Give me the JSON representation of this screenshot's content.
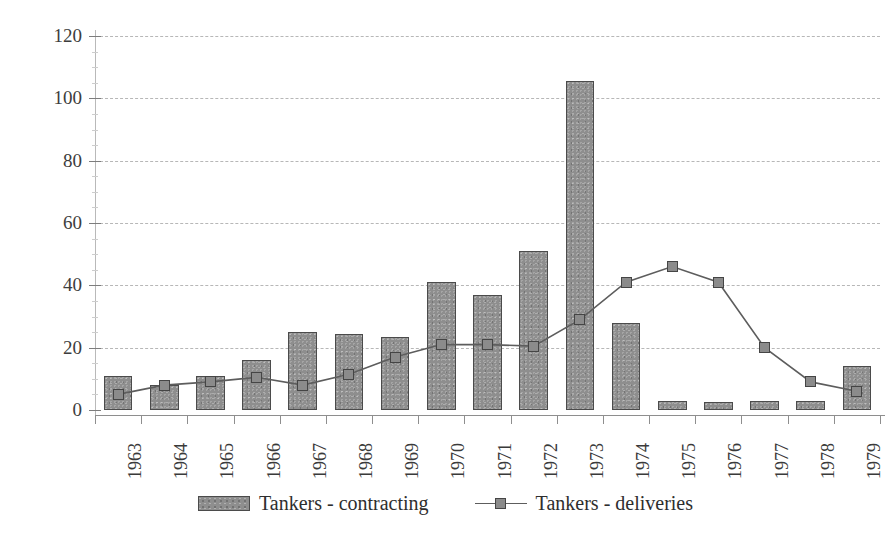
{
  "chart_data": {
    "type": "bar",
    "title": "",
    "xlabel": "",
    "ylabel": "",
    "ylim": [
      0,
      120
    ],
    "yticks": [
      0,
      20,
      40,
      60,
      80,
      100,
      120
    ],
    "grid": true,
    "legend_position": "bottom",
    "categories": [
      "1963",
      "1964",
      "1965",
      "1966",
      "1967",
      "1968",
      "1969",
      "1970",
      "1971",
      "1972",
      "1973",
      "1974",
      "1975",
      "1976",
      "1977",
      "1978",
      "1979"
    ],
    "series": [
      {
        "name": "Tankers - contracting",
        "type": "bar",
        "color": "#8e8e8e",
        "values": [
          11,
          8,
          11,
          16,
          25,
          24.5,
          23.5,
          41,
          37,
          51,
          105.5,
          28,
          3,
          2.5,
          3,
          3,
          14
        ]
      },
      {
        "name": "Tankers - deliveries",
        "type": "line",
        "marker": "square",
        "color": "#5d5d5d",
        "values": [
          5,
          8,
          9,
          10.5,
          8,
          11.5,
          17,
          21,
          21,
          20.5,
          29,
          41,
          46,
          41,
          20,
          9,
          6
        ]
      }
    ]
  },
  "legend": {
    "items": [
      {
        "label": "Tankers - contracting",
        "marker": "bar-swatch"
      },
      {
        "label": "Tankers - deliveries",
        "marker": "line-square-marker"
      }
    ]
  },
  "axes": {
    "y_tick_labels": [
      "120",
      "100",
      "80",
      "60",
      "40",
      "20",
      "0"
    ],
    "x_tick_labels": [
      "1963",
      "1964",
      "1965",
      "1966",
      "1967",
      "1968",
      "1969",
      "1970",
      "1971",
      "1972",
      "1973",
      "1974",
      "1975",
      "1976",
      "1977",
      "1978",
      "1979"
    ]
  }
}
